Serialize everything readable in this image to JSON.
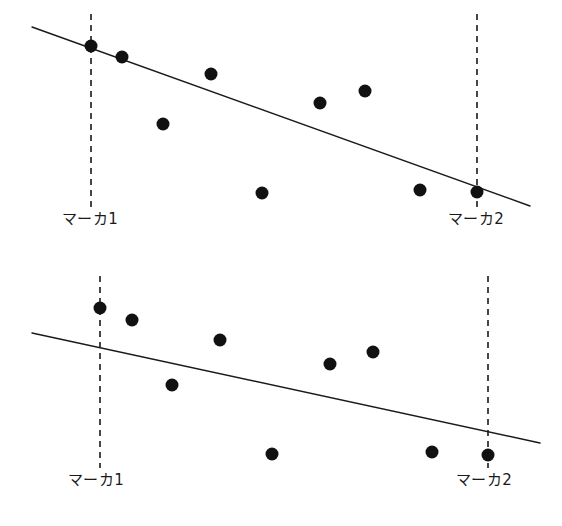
{
  "figure": {
    "background_color": "#ffffff",
    "ink_color": "#1a1a1a",
    "panel_count": 2,
    "width": 562,
    "height": 526
  },
  "chart_data": [
    {
      "type": "scatter",
      "id": "top-panel",
      "title": "",
      "subtitle": "",
      "xlabel": "",
      "ylabel": "",
      "xlim": [
        0,
        562
      ],
      "ylim": [
        263,
        0
      ],
      "grid": false,
      "legend": null,
      "axes_visible": false,
      "tick_labels": [],
      "point_color": "#111111",
      "point_radius": 6.5,
      "points": [
        {
          "x": 91,
          "y": 46
        },
        {
          "x": 122,
          "y": 57
        },
        {
          "x": 163,
          "y": 124
        },
        {
          "x": 211,
          "y": 74
        },
        {
          "x": 262,
          "y": 193
        },
        {
          "x": 320,
          "y": 103
        },
        {
          "x": 365,
          "y": 91
        },
        {
          "x": 420,
          "y": 190
        },
        {
          "x": 477,
          "y": 192
        }
      ],
      "trend_line": {
        "x1": 32,
        "y1": 27,
        "x2": 530,
        "y2": 206,
        "color": "#1a1a1a",
        "width": 1.4
      },
      "markers": [
        {
          "name": "marker-1",
          "x": 91,
          "y_top": 14,
          "y_bottom": 207,
          "label": "マーカ1",
          "label_x": 62,
          "label_y": 212
        },
        {
          "name": "marker-2",
          "x": 477,
          "y_top": 14,
          "y_bottom": 207,
          "label": "マーカ2",
          "label_x": 448,
          "label_y": 212
        }
      ]
    },
    {
      "type": "scatter",
      "id": "bottom-panel",
      "title": "",
      "subtitle": "",
      "xlabel": "",
      "ylabel": "",
      "xlim": [
        0,
        562
      ],
      "ylim": [
        263,
        0
      ],
      "grid": false,
      "legend": null,
      "axes_visible": false,
      "tick_labels": [],
      "point_color": "#111111",
      "point_radius": 6.5,
      "points": [
        {
          "x": 100,
          "y": 45
        },
        {
          "x": 132,
          "y": 57
        },
        {
          "x": 172,
          "y": 122
        },
        {
          "x": 220,
          "y": 77
        },
        {
          "x": 272,
          "y": 191
        },
        {
          "x": 330,
          "y": 101
        },
        {
          "x": 373,
          "y": 89
        },
        {
          "x": 432,
          "y": 189
        },
        {
          "x": 488,
          "y": 192
        }
      ],
      "trend_line": {
        "x1": 32,
        "y1": 70,
        "x2": 540,
        "y2": 180,
        "color": "#1a1a1a",
        "width": 1.4
      },
      "markers": [
        {
          "name": "marker-1",
          "x": 100,
          "y_top": 13,
          "y_bottom": 205,
          "label": "マーカ1",
          "label_x": 68,
          "label_y": 210
        },
        {
          "name": "marker-2",
          "x": 488,
          "y_top": 13,
          "y_bottom": 205,
          "label": "マーカ2",
          "label_x": 456,
          "label_y": 210
        }
      ]
    }
  ]
}
